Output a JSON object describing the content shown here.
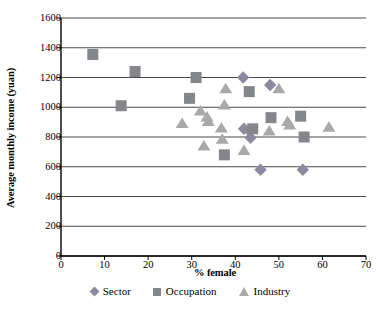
{
  "chart_data": {
    "type": "scatter",
    "title": "",
    "xlabel": "% female",
    "ylabel": "Average monthly income (yuan)",
    "xlim": [
      0,
      70
    ],
    "ylim": [
      0,
      1600
    ],
    "xticks": [
      0,
      10,
      20,
      30,
      40,
      50,
      60,
      70
    ],
    "yticks": [
      0,
      200,
      400,
      600,
      800,
      1000,
      1200,
      1400,
      1600
    ],
    "grid": "horizontal",
    "legend_position": "bottom",
    "series": [
      {
        "name": "Sector",
        "marker": "diamond",
        "color": "#8c8a9e",
        "points": [
          [
            41.8,
            1200
          ],
          [
            48.0,
            1150
          ],
          [
            42.0,
            855
          ],
          [
            43.3,
            840
          ],
          [
            43.5,
            795
          ],
          [
            45.8,
            580
          ],
          [
            55.5,
            580
          ]
        ]
      },
      {
        "name": "Occupation",
        "marker": "square",
        "color": "#85868a",
        "points": [
          [
            7.3,
            1355
          ],
          [
            17.0,
            1240
          ],
          [
            31.0,
            1200
          ],
          [
            13.8,
            1010
          ],
          [
            29.5,
            1060
          ],
          [
            43.2,
            1105
          ],
          [
            37.5,
            680
          ],
          [
            44.0,
            855
          ],
          [
            48.2,
            930
          ],
          [
            55.0,
            940
          ],
          [
            55.8,
            800
          ]
        ]
      },
      {
        "name": "Industry",
        "marker": "triangle",
        "color": "#a9a9ab",
        "points": [
          [
            37.8,
            1130
          ],
          [
            50.0,
            1130
          ],
          [
            37.5,
            1020
          ],
          [
            32.0,
            980
          ],
          [
            33.5,
            940
          ],
          [
            33.8,
            910
          ],
          [
            27.8,
            895
          ],
          [
            52.0,
            910
          ],
          [
            61.5,
            870
          ],
          [
            36.8,
            865
          ],
          [
            47.8,
            845
          ],
          [
            32.8,
            745
          ],
          [
            37.0,
            790
          ],
          [
            42.0,
            715
          ],
          [
            52.5,
            885
          ]
        ]
      }
    ]
  },
  "legend": {
    "items": [
      {
        "label": "Sector"
      },
      {
        "label": "Occupation"
      },
      {
        "label": "Industry"
      }
    ]
  }
}
